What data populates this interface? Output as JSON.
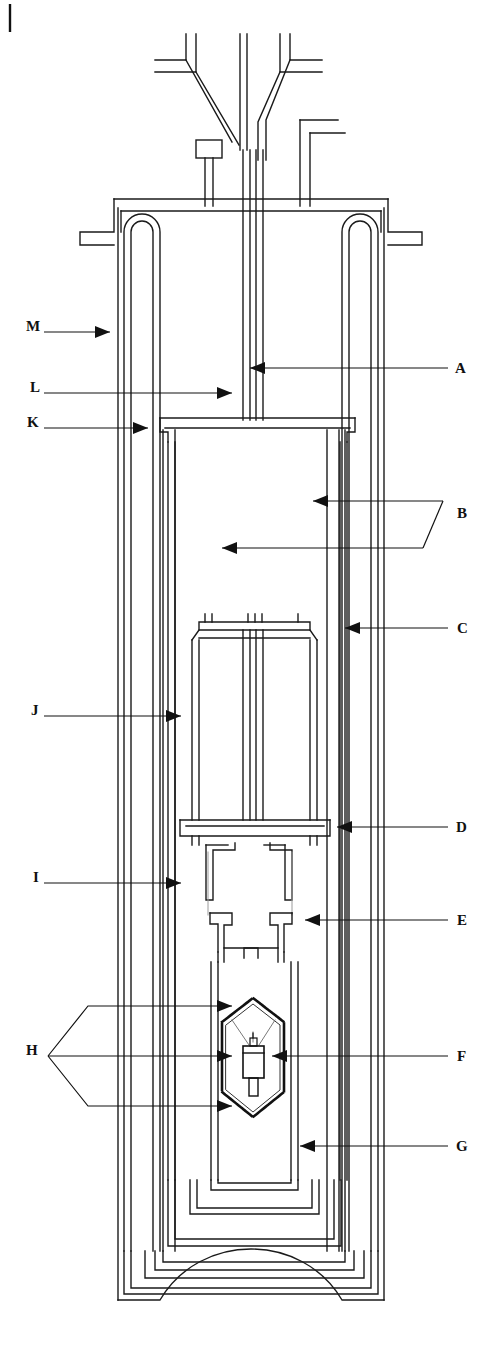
{
  "figure": {
    "kind": "engineering-cross-section",
    "orientation": "vertical",
    "line_color": "#1a1a1a",
    "background_color": "#ffffff",
    "label_color": "#111111",
    "corner_tick": "|"
  },
  "labels": {
    "left": [
      {
        "id": "M",
        "text": "M",
        "x": 26,
        "y": 326,
        "leader_from_x": 44,
        "leader_to_x": 110,
        "leader_y": 332,
        "arrow": "right"
      },
      {
        "id": "L",
        "text": "L",
        "x": 30,
        "y": 387,
        "leader_from_x": 44,
        "leader_to_x": 232,
        "leader_y": 393,
        "arrow": "right"
      },
      {
        "id": "K",
        "text": "K",
        "x": 27,
        "y": 422,
        "leader_from_x": 44,
        "leader_to_x": 148,
        "leader_y": 428,
        "arrow": "right"
      },
      {
        "id": "J",
        "text": "J",
        "x": 31,
        "y": 710,
        "leader_from_x": 44,
        "leader_to_x": 181,
        "leader_y": 716,
        "arrow": "right"
      },
      {
        "id": "I",
        "text": "I",
        "x": 33,
        "y": 877,
        "leader_from_x": 44,
        "leader_to_x": 181,
        "leader_y": 883,
        "arrow": "right"
      },
      {
        "id": "H",
        "text": "H",
        "x": 26,
        "y": 1050,
        "leader_from_x": 44,
        "leader_to_x": 232,
        "leader_y": 1056,
        "arrow": "right",
        "bracket": "three-way-chevron"
      }
    ],
    "right": [
      {
        "id": "A",
        "text": "A",
        "x": 455,
        "y": 372,
        "leader_from_x": 448,
        "leader_to_x": 250,
        "leader_y": 368,
        "arrow": "left"
      },
      {
        "id": "B",
        "text": "B",
        "x": 457,
        "y": 514,
        "leader_to_x": 313,
        "leader_y": 503,
        "arrow": "left",
        "bracket": "slanted-two-way",
        "second_leader_y": 548,
        "second_leader_to_x": 222
      },
      {
        "id": "C",
        "text": "C",
        "x": 457,
        "y": 629,
        "leader_from_x": 448,
        "leader_to_x": 345,
        "leader_y": 628,
        "arrow": "left"
      },
      {
        "id": "D",
        "text": "D",
        "x": 456,
        "y": 828,
        "leader_from_x": 448,
        "leader_to_x": 337,
        "leader_y": 827,
        "arrow": "left"
      },
      {
        "id": "E",
        "text": "E",
        "x": 457,
        "y": 921,
        "leader_from_x": 448,
        "leader_to_x": 305,
        "leader_y": 920,
        "arrow": "left"
      },
      {
        "id": "F",
        "text": "F",
        "x": 457,
        "y": 1056,
        "leader_from_x": 448,
        "leader_to_x": 272,
        "leader_y": 1056,
        "arrow": "left"
      },
      {
        "id": "G",
        "text": "G",
        "x": 456,
        "y": 1147,
        "leader_from_x": 448,
        "leader_to_x": 300,
        "leader_y": 1146,
        "arrow": "left"
      }
    ]
  },
  "callout_count": 13,
  "callout_ids": [
    "A",
    "B",
    "C",
    "D",
    "E",
    "F",
    "G",
    "H",
    "I",
    "J",
    "K",
    "L",
    "M"
  ]
}
